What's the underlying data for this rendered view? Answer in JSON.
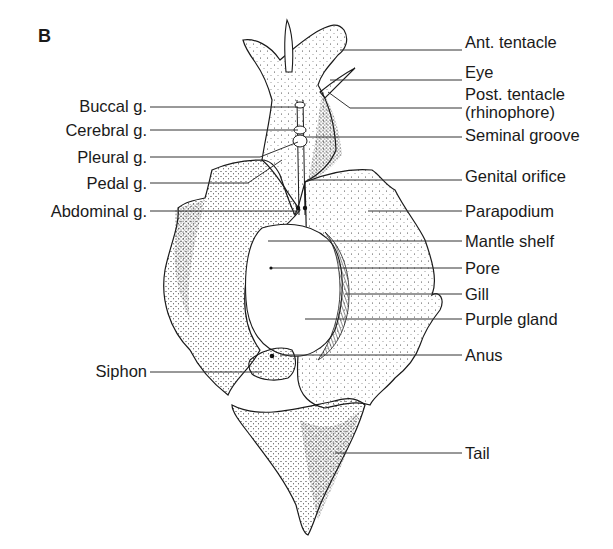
{
  "figure": {
    "panel_letter": "B",
    "colors": {
      "ink": "#1a1a1a",
      "background": "#ffffff"
    }
  },
  "labels_right": [
    {
      "text": "Ant. tentacle",
      "y": 44
    },
    {
      "text": "Eye",
      "y": 74
    },
    {
      "text": "Post. tentacle",
      "y": 96
    },
    {
      "text": "(rhinophore)",
      "y": 114
    },
    {
      "text": "Seminal groove",
      "y": 136
    },
    {
      "text": "Genital orifice",
      "y": 175
    },
    {
      "text": "Parapodium",
      "y": 211
    },
    {
      "text": "Mantle shelf",
      "y": 241
    },
    {
      "text": "Pore",
      "y": 268
    },
    {
      "text": "Gill",
      "y": 294
    },
    {
      "text": "Purple gland",
      "y": 318
    },
    {
      "text": "Anus",
      "y": 354
    },
    {
      "text": "Tail",
      "y": 452
    }
  ],
  "labels_left": [
    {
      "text": "Buccal g.",
      "y": 105
    },
    {
      "text": "Cerebral g.",
      "y": 130
    },
    {
      "text": "Pleural g.",
      "y": 157
    },
    {
      "text": "Pedal g.",
      "y": 184
    },
    {
      "text": "Abdominal g.",
      "y": 213
    },
    {
      "text": "Siphon",
      "y": 370
    }
  ]
}
